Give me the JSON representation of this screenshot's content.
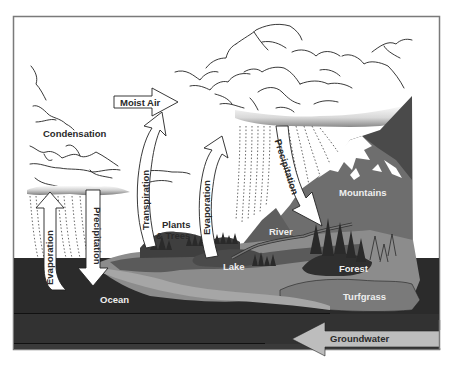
{
  "diagram": {
    "labels": {
      "condensation": "Condensation",
      "moist_air": "Moist Air",
      "transpiration": "Transpiration",
      "evaporation_ocean": "Evaporation",
      "precipitation_ocean": "Precipitation",
      "evaporation_lake": "Evaporation",
      "precipitation_mountain": "Precipitation",
      "plants_trees_line1": "Plants",
      "plants_trees_line2": "& Trees",
      "lake": "Lake",
      "river": "River",
      "mountains": "Mountains",
      "forest": "Forest",
      "turfgrass": "Turfgrass",
      "ocean": "Ocean",
      "groundwater": "Groundwater"
    },
    "colors": {
      "frame": "#7a7a7a",
      "ocean": "#2b2b2b",
      "deep_layer": "#333333",
      "land_light": "#8c8c8c",
      "land_mid": "#6e6e6e",
      "land_dark": "#4a4a4a",
      "trees": "#2f2f2f",
      "snow": "#ffffff",
      "arrow_fill": "#ffffff",
      "groundwater_arrow": "#bdbdbd",
      "cloud_line": "#222222"
    }
  }
}
